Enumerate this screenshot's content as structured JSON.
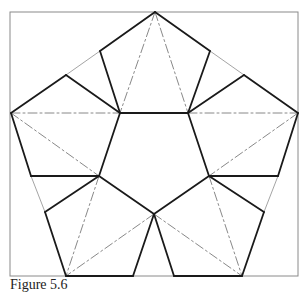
{
  "caption": "Figure 5.6",
  "colors": {
    "frame": "#8a8a8a",
    "thick": "#1a1a1a",
    "thin": "#9a9a9a",
    "dashed": "#7a7a7a",
    "background": "#ffffff"
  },
  "frame": {
    "x": 10,
    "y": 12,
    "w": 288,
    "h": 264
  },
  "thick_lines": [
    [
      [
        155,
        12
      ],
      [
        100,
        51
      ]
    ],
    [
      [
        155,
        12
      ],
      [
        210,
        51
      ]
    ],
    [
      [
        100,
        51
      ],
      [
        120,
        113
      ]
    ],
    [
      [
        210,
        51
      ],
      [
        188,
        113
      ]
    ],
    [
      [
        120,
        113
      ],
      [
        188,
        113
      ]
    ],
    [
      [
        11,
        113
      ],
      [
        66,
        75
      ]
    ],
    [
      [
        66,
        75
      ],
      [
        120,
        113
      ]
    ],
    [
      [
        298,
        113
      ],
      [
        244,
        75
      ]
    ],
    [
      [
        244,
        75
      ],
      [
        188,
        113
      ]
    ],
    [
      [
        11,
        113
      ],
      [
        31,
        176
      ]
    ],
    [
      [
        31,
        176
      ],
      [
        99,
        176
      ]
    ],
    [
      [
        120,
        113
      ],
      [
        99,
        176
      ]
    ],
    [
      [
        298,
        113
      ],
      [
        278,
        176
      ]
    ],
    [
      [
        278,
        176
      ],
      [
        209,
        176
      ]
    ],
    [
      [
        188,
        113
      ],
      [
        209,
        176
      ]
    ],
    [
      [
        99,
        176
      ],
      [
        45,
        212
      ]
    ],
    [
      [
        45,
        212
      ],
      [
        66,
        276
      ]
    ],
    [
      [
        209,
        176
      ],
      [
        264,
        212
      ]
    ],
    [
      [
        264,
        212
      ],
      [
        242,
        276
      ]
    ],
    [
      [
        99,
        176
      ],
      [
        154,
        214
      ]
    ],
    [
      [
        209,
        176
      ],
      [
        154,
        214
      ]
    ],
    [
      [
        154,
        214
      ],
      [
        133,
        276
      ]
    ],
    [
      [
        154,
        214
      ],
      [
        174,
        276
      ]
    ],
    [
      [
        66,
        276
      ],
      [
        133,
        276
      ]
    ],
    [
      [
        174,
        276
      ],
      [
        242,
        276
      ]
    ]
  ],
  "thin_lines": [
    [
      [
        66,
        75
      ],
      [
        100,
        51
      ]
    ],
    [
      [
        210,
        51
      ],
      [
        244,
        75
      ]
    ],
    [
      [
        31,
        176
      ],
      [
        45,
        212
      ]
    ],
    [
      [
        278,
        176
      ],
      [
        264,
        212
      ]
    ]
  ],
  "dashed_lines": [
    [
      [
        11,
        113
      ],
      [
        120,
        113
      ]
    ],
    [
      [
        188,
        113
      ],
      [
        298,
        113
      ]
    ],
    [
      [
        155,
        12
      ],
      [
        120,
        113
      ]
    ],
    [
      [
        155,
        12
      ],
      [
        188,
        113
      ]
    ],
    [
      [
        11,
        113
      ],
      [
        99,
        176
      ]
    ],
    [
      [
        298,
        113
      ],
      [
        209,
        176
      ]
    ],
    [
      [
        99,
        176
      ],
      [
        66,
        276
      ]
    ],
    [
      [
        209,
        176
      ],
      [
        242,
        276
      ]
    ],
    [
      [
        154,
        214
      ],
      [
        66,
        276
      ]
    ],
    [
      [
        154,
        214
      ],
      [
        242,
        276
      ]
    ]
  ]
}
